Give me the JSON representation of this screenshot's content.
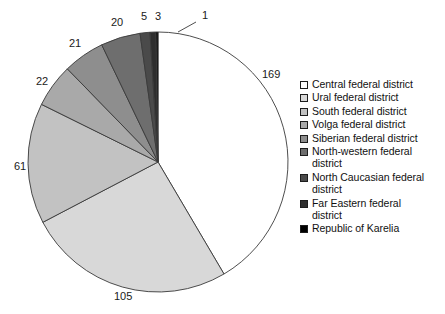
{
  "chart_data": {
    "type": "pie",
    "title": "",
    "total": 407,
    "start_angle_deg": 0,
    "direction": "clockwise",
    "categories": [
      "Central federal district",
      "Ural federal district",
      "South federal district",
      "Volga federal district",
      "Siberian federal district",
      "North-western federal district",
      "North Caucasian federal district",
      "Far Eastern federal district",
      "Republic of Karelia"
    ],
    "values": [
      169,
      105,
      61,
      22,
      21,
      20,
      5,
      3,
      1
    ],
    "colors": [
      "#ffffff",
      "#d8d8d8",
      "#c2c2c2",
      "#a9a9a9",
      "#8e8e8e",
      "#6e6e6e",
      "#4a4a4a",
      "#2e2e2e",
      "#000000"
    ],
    "legend_position": "right",
    "grid": false,
    "xlabel": "",
    "ylabel": ""
  },
  "pie": {
    "center_x": 158,
    "center_y": 162,
    "radius": 130,
    "stroke": "#3a3a3a",
    "labels": [
      {
        "text": "169",
        "x": 262,
        "y": 78
      },
      {
        "text": "105",
        "x": 114,
        "y": 300
      },
      {
        "text": "61",
        "x": 14,
        "y": 170
      },
      {
        "text": "22",
        "x": 36,
        "y": 85
      },
      {
        "text": "21",
        "x": 69,
        "y": 47
      },
      {
        "text": "20",
        "x": 111,
        "y": 26
      },
      {
        "text": "5",
        "x": 141,
        "y": 20
      },
      {
        "text": "3",
        "x": 155,
        "y": 20
      },
      {
        "text": "1",
        "x": 202,
        "y": 19
      }
    ],
    "leader_line": {
      "x1": 178,
      "y1": 32,
      "x2": 196,
      "y2": 22
    }
  },
  "legend": {
    "items": [
      {
        "label": "Central federal district",
        "color": "#ffffff"
      },
      {
        "label": "Ural federal district",
        "color": "#d8d8d8"
      },
      {
        "label": "South federal district",
        "color": "#c2c2c2"
      },
      {
        "label": "Volga federal district",
        "color": "#a9a9a9"
      },
      {
        "label": "Siberian federal district",
        "color": "#8e8e8e"
      },
      {
        "label": "North-western federal\ndistrict",
        "color": "#6e6e6e"
      },
      {
        "label": "North Caucasian federal\ndistrict",
        "color": "#4a4a4a"
      },
      {
        "label": "Far Eastern federal\ndistrict",
        "color": "#2e2e2e"
      },
      {
        "label": "Republic of Karelia",
        "color": "#000000"
      }
    ]
  }
}
